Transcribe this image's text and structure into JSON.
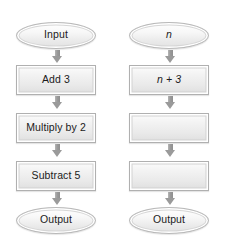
{
  "diagram": {
    "type": "flowchart",
    "orientation": "top-to-bottom",
    "colors": {
      "shape_fill_light": "#fcfcfc",
      "shape_fill_dark": "#dedede",
      "shape_border": "#b0b0b0",
      "arrow": "#9a9a9a",
      "text": "#1b1b1b",
      "background": "#ffffff"
    },
    "columns": [
      {
        "name": "operations-column",
        "nodes": [
          {
            "id": "left-start",
            "shape": "oval",
            "label": "Input",
            "italic": false
          },
          {
            "id": "left-step-1",
            "shape": "rect",
            "label": "Add 3",
            "italic": false
          },
          {
            "id": "left-step-2",
            "shape": "rect",
            "label": "Multiply by 2",
            "italic": false
          },
          {
            "id": "left-step-3",
            "shape": "rect",
            "label": "Subtract 5",
            "italic": false
          },
          {
            "id": "left-end",
            "shape": "oval",
            "label": "Output",
            "italic": false
          }
        ],
        "connectors": [
          {
            "id": "left-arrow-1",
            "icon": "arrow-down-icon",
            "from": "left-start",
            "to": "left-step-1"
          },
          {
            "id": "left-arrow-2",
            "icon": "arrow-down-icon",
            "from": "left-step-1",
            "to": "left-step-2"
          },
          {
            "id": "left-arrow-3",
            "icon": "arrow-down-icon",
            "from": "left-step-2",
            "to": "left-step-3"
          },
          {
            "id": "left-arrow-4",
            "icon": "arrow-down-icon",
            "from": "left-step-3",
            "to": "left-end"
          }
        ]
      },
      {
        "name": "expressions-column",
        "nodes": [
          {
            "id": "right-start",
            "shape": "oval",
            "label": "n",
            "italic": true
          },
          {
            "id": "right-step-1",
            "shape": "rect",
            "label": "n + 3",
            "italic": true
          },
          {
            "id": "right-step-2",
            "shape": "rect",
            "label": "",
            "italic": false
          },
          {
            "id": "right-step-3",
            "shape": "rect",
            "label": "",
            "italic": false
          },
          {
            "id": "right-end",
            "shape": "oval",
            "label": "Output",
            "italic": false
          }
        ],
        "connectors": [
          {
            "id": "right-arrow-1",
            "icon": "arrow-down-icon",
            "from": "right-start",
            "to": "right-step-1"
          },
          {
            "id": "right-arrow-2",
            "icon": "arrow-down-icon",
            "from": "right-step-1",
            "to": "right-step-2"
          },
          {
            "id": "right-arrow-3",
            "icon": "arrow-down-icon",
            "from": "right-step-2",
            "to": "right-step-3"
          },
          {
            "id": "right-arrow-4",
            "icon": "arrow-down-icon",
            "from": "right-step-3",
            "to": "right-end"
          }
        ]
      }
    ]
  }
}
